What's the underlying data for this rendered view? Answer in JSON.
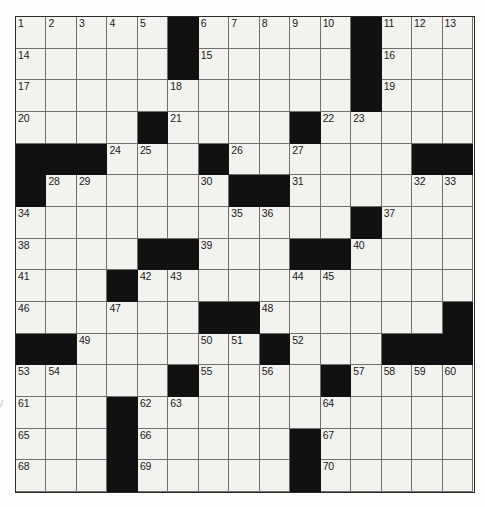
{
  "puzzle": {
    "type": "crossword-grid",
    "rows": 15,
    "columns": 15,
    "colors": {
      "block": "#111111",
      "cell": "#f2f2ef",
      "grid_line": "#6f6f6f",
      "border": "#2b2b2b",
      "number": "#1b1b1b",
      "page_background": "#ffffff"
    },
    "margin_mark": "/",
    "grid": [
      [
        {
          "black": false,
          "number": "1"
        },
        {
          "black": false,
          "number": "2"
        },
        {
          "black": false,
          "number": "3"
        },
        {
          "black": false,
          "number": "4"
        },
        {
          "black": false,
          "number": "5"
        },
        {
          "black": true,
          "number": ""
        },
        {
          "black": false,
          "number": "6"
        },
        {
          "black": false,
          "number": "7"
        },
        {
          "black": false,
          "number": "8"
        },
        {
          "black": false,
          "number": "9"
        },
        {
          "black": false,
          "number": "10"
        },
        {
          "black": true,
          "number": ""
        },
        {
          "black": false,
          "number": "11"
        },
        {
          "black": false,
          "number": "12"
        },
        {
          "black": false,
          "number": "13"
        }
      ],
      [
        {
          "black": false,
          "number": "14"
        },
        {
          "black": false,
          "number": ""
        },
        {
          "black": false,
          "number": ""
        },
        {
          "black": false,
          "number": ""
        },
        {
          "black": false,
          "number": ""
        },
        {
          "black": true,
          "number": ""
        },
        {
          "black": false,
          "number": "15"
        },
        {
          "black": false,
          "number": ""
        },
        {
          "black": false,
          "number": ""
        },
        {
          "black": false,
          "number": ""
        },
        {
          "black": false,
          "number": ""
        },
        {
          "black": true,
          "number": ""
        },
        {
          "black": false,
          "number": "16"
        },
        {
          "black": false,
          "number": ""
        },
        {
          "black": false,
          "number": ""
        }
      ],
      [
        {
          "black": false,
          "number": "17"
        },
        {
          "black": false,
          "number": ""
        },
        {
          "black": false,
          "number": ""
        },
        {
          "black": false,
          "number": ""
        },
        {
          "black": false,
          "number": ""
        },
        {
          "black": false,
          "number": "18"
        },
        {
          "black": false,
          "number": ""
        },
        {
          "black": false,
          "number": ""
        },
        {
          "black": false,
          "number": ""
        },
        {
          "black": false,
          "number": ""
        },
        {
          "black": false,
          "number": ""
        },
        {
          "black": true,
          "number": ""
        },
        {
          "black": false,
          "number": "19"
        },
        {
          "black": false,
          "number": ""
        },
        {
          "black": false,
          "number": ""
        }
      ],
      [
        {
          "black": false,
          "number": "20"
        },
        {
          "black": false,
          "number": ""
        },
        {
          "black": false,
          "number": ""
        },
        {
          "black": false,
          "number": ""
        },
        {
          "black": true,
          "number": ""
        },
        {
          "black": false,
          "number": "21"
        },
        {
          "black": false,
          "number": ""
        },
        {
          "black": false,
          "number": ""
        },
        {
          "black": false,
          "number": ""
        },
        {
          "black": true,
          "number": ""
        },
        {
          "black": false,
          "number": "22"
        },
        {
          "black": false,
          "number": "23"
        },
        {
          "black": false,
          "number": ""
        },
        {
          "black": false,
          "number": ""
        },
        {
          "black": false,
          "number": ""
        }
      ],
      [
        {
          "black": true,
          "number": ""
        },
        {
          "black": true,
          "number": ""
        },
        {
          "black": true,
          "number": ""
        },
        {
          "black": false,
          "number": "24"
        },
        {
          "black": false,
          "number": "25"
        },
        {
          "black": false,
          "number": ""
        },
        {
          "black": true,
          "number": ""
        },
        {
          "black": false,
          "number": "26"
        },
        {
          "black": false,
          "number": ""
        },
        {
          "black": false,
          "number": "27"
        },
        {
          "black": false,
          "number": ""
        },
        {
          "black": false,
          "number": ""
        },
        {
          "black": false,
          "number": ""
        },
        {
          "black": true,
          "number": ""
        },
        {
          "black": true,
          "number": ""
        }
      ],
      [
        {
          "black": true,
          "number": ""
        },
        {
          "black": false,
          "number": "28"
        },
        {
          "black": false,
          "number": "29"
        },
        {
          "black": false,
          "number": ""
        },
        {
          "black": false,
          "number": ""
        },
        {
          "black": false,
          "number": ""
        },
        {
          "black": false,
          "number": "30"
        },
        {
          "black": true,
          "number": ""
        },
        {
          "black": true,
          "number": ""
        },
        {
          "black": false,
          "number": "31"
        },
        {
          "black": false,
          "number": ""
        },
        {
          "black": false,
          "number": ""
        },
        {
          "black": false,
          "number": ""
        },
        {
          "black": false,
          "number": "32"
        },
        {
          "black": false,
          "number": "33"
        }
      ],
      [
        {
          "black": false,
          "number": "34"
        },
        {
          "black": false,
          "number": ""
        },
        {
          "black": false,
          "number": ""
        },
        {
          "black": false,
          "number": ""
        },
        {
          "black": false,
          "number": ""
        },
        {
          "black": false,
          "number": ""
        },
        {
          "black": false,
          "number": ""
        },
        {
          "black": false,
          "number": "35"
        },
        {
          "black": false,
          "number": "36"
        },
        {
          "black": false,
          "number": ""
        },
        {
          "black": false,
          "number": ""
        },
        {
          "black": true,
          "number": ""
        },
        {
          "black": false,
          "number": "37"
        },
        {
          "black": false,
          "number": ""
        },
        {
          "black": false,
          "number": ""
        }
      ],
      [
        {
          "black": false,
          "number": "38"
        },
        {
          "black": false,
          "number": ""
        },
        {
          "black": false,
          "number": ""
        },
        {
          "black": false,
          "number": ""
        },
        {
          "black": true,
          "number": ""
        },
        {
          "black": true,
          "number": ""
        },
        {
          "black": false,
          "number": "39"
        },
        {
          "black": false,
          "number": ""
        },
        {
          "black": false,
          "number": ""
        },
        {
          "black": true,
          "number": ""
        },
        {
          "black": true,
          "number": ""
        },
        {
          "black": false,
          "number": "40"
        },
        {
          "black": false,
          "number": ""
        },
        {
          "black": false,
          "number": ""
        },
        {
          "black": false,
          "number": ""
        }
      ],
      [
        {
          "black": false,
          "number": "41"
        },
        {
          "black": false,
          "number": ""
        },
        {
          "black": false,
          "number": ""
        },
        {
          "black": true,
          "number": ""
        },
        {
          "black": false,
          "number": "42"
        },
        {
          "black": false,
          "number": "43"
        },
        {
          "black": false,
          "number": ""
        },
        {
          "black": false,
          "number": ""
        },
        {
          "black": false,
          "number": ""
        },
        {
          "black": false,
          "number": "44"
        },
        {
          "black": false,
          "number": "45"
        },
        {
          "black": false,
          "number": ""
        },
        {
          "black": false,
          "number": ""
        },
        {
          "black": false,
          "number": ""
        },
        {
          "black": false,
          "number": ""
        }
      ],
      [
        {
          "black": false,
          "number": "46"
        },
        {
          "black": false,
          "number": ""
        },
        {
          "black": false,
          "number": ""
        },
        {
          "black": false,
          "number": "47"
        },
        {
          "black": false,
          "number": ""
        },
        {
          "black": false,
          "number": ""
        },
        {
          "black": true,
          "number": ""
        },
        {
          "black": true,
          "number": ""
        },
        {
          "black": false,
          "number": "48"
        },
        {
          "black": false,
          "number": ""
        },
        {
          "black": false,
          "number": ""
        },
        {
          "black": false,
          "number": ""
        },
        {
          "black": false,
          "number": ""
        },
        {
          "black": false,
          "number": ""
        },
        {
          "black": true,
          "number": ""
        }
      ],
      [
        {
          "black": true,
          "number": ""
        },
        {
          "black": true,
          "number": ""
        },
        {
          "black": false,
          "number": "49"
        },
        {
          "black": false,
          "number": ""
        },
        {
          "black": false,
          "number": ""
        },
        {
          "black": false,
          "number": ""
        },
        {
          "black": false,
          "number": "50"
        },
        {
          "black": false,
          "number": "51"
        },
        {
          "black": true,
          "number": ""
        },
        {
          "black": false,
          "number": "52"
        },
        {
          "black": false,
          "number": ""
        },
        {
          "black": false,
          "number": ""
        },
        {
          "black": true,
          "number": ""
        },
        {
          "black": true,
          "number": ""
        },
        {
          "black": true,
          "number": ""
        }
      ],
      [
        {
          "black": false,
          "number": "53"
        },
        {
          "black": false,
          "number": "54"
        },
        {
          "black": false,
          "number": ""
        },
        {
          "black": false,
          "number": ""
        },
        {
          "black": false,
          "number": ""
        },
        {
          "black": true,
          "number": ""
        },
        {
          "black": false,
          "number": "55"
        },
        {
          "black": false,
          "number": ""
        },
        {
          "black": false,
          "number": "56"
        },
        {
          "black": false,
          "number": ""
        },
        {
          "black": true,
          "number": ""
        },
        {
          "black": false,
          "number": "57"
        },
        {
          "black": false,
          "number": "58"
        },
        {
          "black": false,
          "number": "59"
        },
        {
          "black": false,
          "number": "60"
        }
      ],
      [
        {
          "black": false,
          "number": "61"
        },
        {
          "black": false,
          "number": ""
        },
        {
          "black": false,
          "number": ""
        },
        {
          "black": true,
          "number": ""
        },
        {
          "black": false,
          "number": "62"
        },
        {
          "black": false,
          "number": "63"
        },
        {
          "black": false,
          "number": ""
        },
        {
          "black": false,
          "number": ""
        },
        {
          "black": false,
          "number": ""
        },
        {
          "black": false,
          "number": ""
        },
        {
          "black": false,
          "number": "64"
        },
        {
          "black": false,
          "number": ""
        },
        {
          "black": false,
          "number": ""
        },
        {
          "black": false,
          "number": ""
        },
        {
          "black": false,
          "number": ""
        }
      ],
      [
        {
          "black": false,
          "number": "65"
        },
        {
          "black": false,
          "number": ""
        },
        {
          "black": false,
          "number": ""
        },
        {
          "black": true,
          "number": ""
        },
        {
          "black": false,
          "number": "66"
        },
        {
          "black": false,
          "number": ""
        },
        {
          "black": false,
          "number": ""
        },
        {
          "black": false,
          "number": ""
        },
        {
          "black": false,
          "number": ""
        },
        {
          "black": true,
          "number": ""
        },
        {
          "black": false,
          "number": "67"
        },
        {
          "black": false,
          "number": ""
        },
        {
          "black": false,
          "number": ""
        },
        {
          "black": false,
          "number": ""
        },
        {
          "black": false,
          "number": ""
        }
      ],
      [
        {
          "black": false,
          "number": "68"
        },
        {
          "black": false,
          "number": ""
        },
        {
          "black": false,
          "number": ""
        },
        {
          "black": true,
          "number": ""
        },
        {
          "black": false,
          "number": "69"
        },
        {
          "black": false,
          "number": ""
        },
        {
          "black": false,
          "number": ""
        },
        {
          "black": false,
          "number": ""
        },
        {
          "black": false,
          "number": ""
        },
        {
          "black": true,
          "number": ""
        },
        {
          "black": false,
          "number": "70"
        },
        {
          "black": false,
          "number": ""
        },
        {
          "black": false,
          "number": ""
        },
        {
          "black": false,
          "number": ""
        },
        {
          "black": false,
          "number": ""
        }
      ]
    ]
  }
}
